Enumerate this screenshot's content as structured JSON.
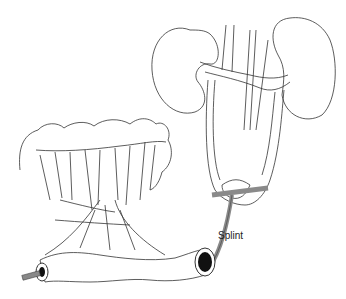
{
  "diagram": {
    "labels": {
      "splint": "Splint"
    },
    "structures": [
      "kidneys",
      "ureters",
      "bladder",
      "colon",
      "ileal-conduit",
      "mesentery",
      "splint"
    ],
    "colors": {
      "line": "#333333",
      "splint": "#8a8a8a",
      "stoma": "#111111"
    }
  }
}
